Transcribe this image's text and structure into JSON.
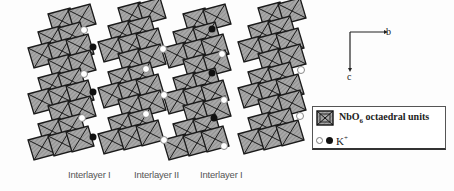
{
  "figure": {
    "colors": {
      "octahedron_fill": "#9a9a9a",
      "octahedron_edge": "#1a1a1a",
      "ion_open_stroke": "#888888",
      "ion_filled": "#111111"
    },
    "interlayer_labels": [
      {
        "text": "Interlayer I",
        "x": 68
      },
      {
        "text": "Interlayer II",
        "x": 134
      },
      {
        "text": "Interlayer I",
        "x": 200
      }
    ],
    "axes": {
      "b_label": "b",
      "c_label": "c"
    },
    "legend": {
      "octahedra_label_main": "NbO",
      "octahedra_label_sub": "6",
      "octahedra_label_rest": " octaedral units",
      "ion_label_main": "K",
      "ion_label_sup": "+"
    },
    "ions": {
      "open": [
        [
          84,
          30
        ],
        [
          84,
          74
        ],
        [
          82,
          118
        ],
        [
          146,
          69
        ],
        [
          163,
          49
        ],
        [
          164,
          95
        ],
        [
          146,
          114
        ],
        [
          164,
          140
        ],
        [
          222,
          54
        ],
        [
          224,
          100
        ],
        [
          224,
          146
        ],
        [
          301,
          70
        ],
        [
          300,
          116
        ]
      ],
      "filled": [
        [
          93,
          47
        ],
        [
          93,
          92
        ],
        [
          93,
          137
        ],
        [
          212,
          29
        ],
        [
          212,
          73
        ],
        [
          214,
          118
        ]
      ]
    },
    "octahedron_columns": [
      {
        "name": "layer-1",
        "x0": 30,
        "shift": 10
      },
      {
        "name": "layer-2",
        "x0": 100,
        "shift": 10
      },
      {
        "name": "layer-3",
        "x0": 165,
        "shift": 10
      },
      {
        "name": "layer-4",
        "x0": 240,
        "shift": 10
      }
    ]
  }
}
